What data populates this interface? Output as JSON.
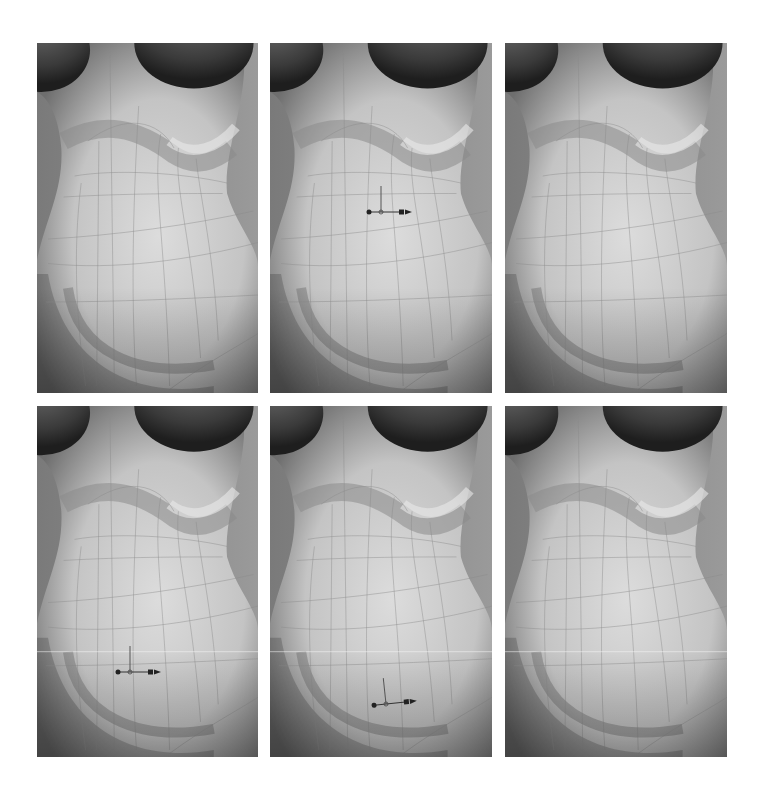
{
  "figure": {
    "background_color": "#ffffff",
    "skin_light": "#dcdcdc",
    "skin_mid": "#b4b4b4",
    "skin_dark": "#3a3a3a",
    "wire_color": "#8a8a8a",
    "gizmo_color": "#222222",
    "panels": [
      {
        "id": 1,
        "row": 1,
        "col": 1,
        "x": 37,
        "y": 43,
        "w": 221,
        "h": 350,
        "gizmo": null,
        "highlight_line": false
      },
      {
        "id": 2,
        "row": 1,
        "col": 2,
        "x": 270,
        "y": 43,
        "w": 222,
        "h": 350,
        "gizmo": {
          "x": 111,
          "y": 169,
          "rotation": 0
        },
        "highlight_line": false
      },
      {
        "id": 3,
        "row": 1,
        "col": 3,
        "x": 505,
        "y": 43,
        "w": 222,
        "h": 350,
        "gizmo": null,
        "highlight_line": false
      },
      {
        "id": 4,
        "row": 2,
        "col": 1,
        "x": 37,
        "y": 406,
        "w": 221,
        "h": 351,
        "gizmo": {
          "x": 93,
          "y": 266,
          "rotation": 0
        },
        "highlight_line": true
      },
      {
        "id": 5,
        "row": 2,
        "col": 2,
        "x": 270,
        "y": 406,
        "w": 222,
        "h": 351,
        "gizmo": {
          "x": 116,
          "y": 298,
          "rotation": -6
        },
        "highlight_line": true
      },
      {
        "id": 6,
        "row": 2,
        "col": 3,
        "x": 505,
        "y": 406,
        "w": 222,
        "h": 351,
        "gizmo": null,
        "highlight_line": true
      }
    ],
    "gizmo_icon": "move-transform-gizmo-icon"
  }
}
